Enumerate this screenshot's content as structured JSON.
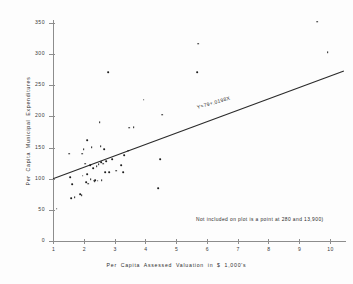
{
  "chart_data": {
    "type": "scatter",
    "title": "",
    "xlabel": "Per Capita  Assessed Valuation in $ 1,000's",
    "ylabel": "Per Capita Municipal Expenditures",
    "xlim": [
      1,
      10.6
    ],
    "ylim": [
      0,
      365
    ],
    "xticks": [
      "1",
      "2",
      "3",
      "4",
      "5",
      "6",
      "7",
      "8",
      "9",
      "10"
    ],
    "xtick_values": [
      1,
      2,
      3,
      4,
      5,
      6,
      7,
      8,
      9,
      10
    ],
    "yticks": [
      "0",
      "50",
      "100",
      "150",
      "200",
      "250",
      "300",
      "350"
    ],
    "ytick_values": [
      0,
      50,
      100,
      150,
      200,
      250,
      300,
      350
    ],
    "grid": false,
    "legend": null,
    "point_color": "#1d1d1d",
    "axis_color": "#8d8d8d",
    "line_color": "#2a2a2a",
    "points": [
      [
        1.12,
        52
      ],
      [
        1.52,
        140
      ],
      [
        1.55,
        102
      ],
      [
        1.58,
        69
      ],
      [
        1.62,
        91
      ],
      [
        1.7,
        70
      ],
      [
        1.88,
        75
      ],
      [
        1.93,
        74
      ],
      [
        1.95,
        140
      ],
      [
        1.96,
        105
      ],
      [
        2.0,
        148
      ],
      [
        2.05,
        124
      ],
      [
        2.08,
        94
      ],
      [
        2.1,
        162
      ],
      [
        2.12,
        107
      ],
      [
        2.15,
        92
      ],
      [
        2.2,
        122
      ],
      [
        2.22,
        99
      ],
      [
        2.26,
        151
      ],
      [
        2.3,
        117
      ],
      [
        2.32,
        97
      ],
      [
        2.35,
        96
      ],
      [
        2.38,
        98
      ],
      [
        2.42,
        120
      ],
      [
        2.45,
        97
      ],
      [
        2.48,
        123
      ],
      [
        2.52,
        191
      ],
      [
        2.55,
        152
      ],
      [
        2.56,
        127
      ],
      [
        2.58,
        98
      ],
      [
        2.62,
        124
      ],
      [
        2.66,
        147
      ],
      [
        2.7,
        110
      ],
      [
        2.72,
        128
      ],
      [
        2.8,
        271
      ],
      [
        2.82,
        110
      ],
      [
        2.92,
        131
      ],
      [
        3.05,
        113
      ],
      [
        3.22,
        122
      ],
      [
        3.28,
        110
      ],
      [
        3.32,
        138
      ],
      [
        3.45,
        145
      ],
      [
        3.48,
        182
      ],
      [
        3.62,
        183
      ],
      [
        3.95,
        227
      ],
      [
        4.42,
        85
      ],
      [
        4.48,
        131
      ],
      [
        4.55,
        203
      ],
      [
        5.68,
        271
      ],
      [
        5.72,
        317
      ],
      [
        9.58,
        352
      ],
      [
        9.92,
        303
      ]
    ],
    "regression": {
      "equation_label": "Y=79+.0198X",
      "x_start": 1.0,
      "y_start": 100,
      "x_end": 10.45,
      "y_end": 273
    },
    "footnote": "Not included on plot is a point at 280 and 13,900)"
  }
}
